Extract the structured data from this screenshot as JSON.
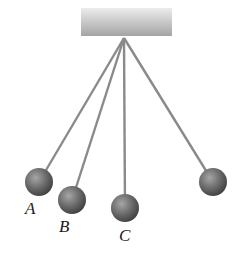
{
  "diagram": {
    "type": "pendulum-set",
    "support": {
      "x": 81,
      "y": 8,
      "width": 91,
      "height": 28,
      "color_top": "#e8e8e8",
      "color_bottom": "#a8a8a8"
    },
    "pivot": {
      "x": 124,
      "y": 38
    },
    "string_color": "#8a8a8a",
    "ball_color": "#6e6e6e",
    "pendulums": [
      {
        "id": "A",
        "label": "A",
        "ball": {
          "x": 39,
          "y": 182,
          "r": 14
        },
        "label_pos": {
          "x": 25,
          "y": 199
        }
      },
      {
        "id": "B",
        "label": "B",
        "ball": {
          "x": 72,
          "y": 200,
          "r": 14
        },
        "label_pos": {
          "x": 59,
          "y": 217
        }
      },
      {
        "id": "C",
        "label": "C",
        "ball": {
          "x": 125,
          "y": 208,
          "r": 14
        },
        "label_pos": {
          "x": 119,
          "y": 226
        }
      },
      {
        "id": "D",
        "label": "",
        "ball": {
          "x": 213,
          "y": 182,
          "r": 14
        },
        "label_pos": null
      }
    ]
  }
}
